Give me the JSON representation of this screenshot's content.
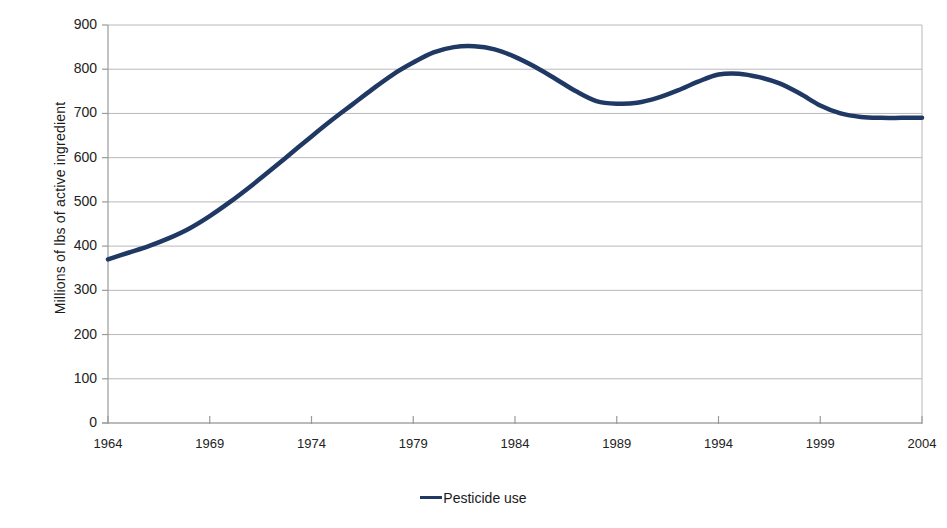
{
  "chart_data": {
    "type": "line",
    "title": "",
    "xlabel": "",
    "ylabel": "Millions of lbs of active ingredient",
    "xlim": [
      1964,
      2004
    ],
    "ylim": [
      0,
      900
    ],
    "grid": true,
    "legend_position": "bottom",
    "x_ticks": [
      "1964",
      "1969",
      "1974",
      "1979",
      "1984",
      "1989",
      "1994",
      "1999",
      "2004"
    ],
    "y_ticks": [
      "0",
      "100",
      "200",
      "300",
      "400",
      "500",
      "600",
      "700",
      "800",
      "900"
    ],
    "series": [
      {
        "name": "Pesticide use",
        "color": "#1F3864",
        "x": [
          1964,
          1965,
          1966,
          1967,
          1968,
          1969,
          1970,
          1971,
          1972,
          1973,
          1974,
          1975,
          1976,
          1977,
          1978,
          1979,
          1980,
          1981,
          1982,
          1983,
          1984,
          1985,
          1986,
          1987,
          1988,
          1989,
          1990,
          1991,
          1992,
          1993,
          1994,
          1995,
          1996,
          1997,
          1998,
          1999,
          2000,
          2001,
          2002,
          2003,
          2004
        ],
        "values": [
          370,
          385,
          400,
          418,
          440,
          468,
          500,
          535,
          572,
          610,
          648,
          685,
          720,
          755,
          788,
          815,
          838,
          850,
          852,
          845,
          828,
          805,
          778,
          750,
          728,
          722,
          724,
          735,
          752,
          772,
          788,
          790,
          782,
          768,
          745,
          718,
          700,
          692,
          690,
          690,
          690
        ]
      }
    ],
    "legend_entries": [
      "Pesticide use"
    ]
  },
  "labels": {
    "y_axis_title": "Millions of lbs of active ingredient",
    "legend_label": "Pesticide use",
    "footnote": ""
  },
  "colors": {
    "line": "#1F3864",
    "grid": "#b9b9b9",
    "axis": "#9a9a9a",
    "text": "#222222"
  }
}
